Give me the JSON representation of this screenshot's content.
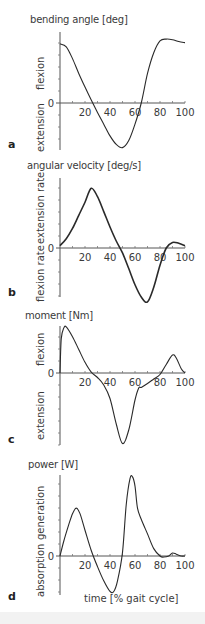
{
  "figure": {
    "xlabel": "time [% gait cycle]",
    "x_ticks": [
      "20",
      "40",
      "60",
      "80",
      "100"
    ],
    "zero_label": "0"
  },
  "panels": [
    {
      "letter": "a",
      "title": "bending angle  [deg]",
      "pos_label": "flexion",
      "neg_label": "extension"
    },
    {
      "letter": "b",
      "title": "angular velocity  [deg/s]",
      "pos_label": "extension rate",
      "neg_label": "flexion rate"
    },
    {
      "letter": "c",
      "title": "moment [Nm]",
      "pos_label": "flexion",
      "neg_label": "extension"
    },
    {
      "letter": "d",
      "title": "power [W]",
      "pos_label": "generation",
      "neg_label": "absorption"
    }
  ],
  "chart_data": [
    {
      "type": "line",
      "title": "bending angle [deg]",
      "xlabel": "time [% gait cycle]",
      "ylabel": "flexion (+) / extension (-)",
      "xlim": [
        0,
        100
      ],
      "ylim": [
        -1,
        1.2
      ],
      "grid": false,
      "x": [
        0,
        5,
        10,
        15,
        20,
        25,
        30,
        35,
        40,
        45,
        50,
        55,
        60,
        65,
        70,
        75,
        80,
        85,
        90,
        95,
        100
      ],
      "values": [
        1.0,
        0.95,
        0.75,
        0.5,
        0.27,
        0.05,
        -0.2,
        -0.45,
        -0.7,
        -0.88,
        -0.95,
        -0.8,
        -0.45,
        0.0,
        0.5,
        0.85,
        1.05,
        1.08,
        1.07,
        1.04,
        1.02
      ]
    },
    {
      "type": "line",
      "title": "angular velocity [deg/s]",
      "xlabel": "time [% gait cycle]",
      "ylabel": "extension rate (+) / flexion rate (-)",
      "xlim": [
        0,
        100
      ],
      "ylim": [
        -1,
        1.5
      ],
      "grid": false,
      "x": [
        0,
        5,
        10,
        15,
        20,
        25,
        30,
        35,
        40,
        45,
        50,
        55,
        60,
        65,
        70,
        75,
        80,
        85,
        90,
        95,
        100
      ],
      "values": [
        0.05,
        0.2,
        0.42,
        0.7,
        0.98,
        1.28,
        1.1,
        0.78,
        0.45,
        0.15,
        -0.1,
        -0.42,
        -0.75,
        -1.0,
        -1.1,
        -0.8,
        -0.35,
        0.0,
        0.12,
        0.1,
        0.05
      ]
    },
    {
      "type": "line",
      "title": "moment [Nm]",
      "xlabel": "time [% gait cycle]",
      "ylabel": "flexion (+) / extension (-)",
      "xlim": [
        0,
        100
      ],
      "ylim": [
        -2.4,
        1.1
      ],
      "grid": false,
      "x": [
        0,
        1,
        3,
        5,
        10,
        15,
        20,
        25,
        30,
        35,
        40,
        45,
        50,
        55,
        60,
        63,
        65,
        70,
        75,
        80,
        85,
        90,
        93,
        97,
        100
      ],
      "values": [
        0.0,
        0.8,
        1.05,
        1.08,
        0.85,
        0.55,
        0.25,
        0.02,
        -0.15,
        -0.4,
        -0.85,
        -1.7,
        -2.35,
        -1.9,
        -0.9,
        -0.5,
        -0.48,
        -0.35,
        -0.2,
        -0.05,
        0.2,
        0.42,
        0.35,
        0.1,
        0.0
      ]
    },
    {
      "type": "line",
      "title": "power [W]",
      "xlabel": "time [% gait cycle]",
      "ylabel": "generation (+) / absorption (-)",
      "xlim": [
        0,
        100
      ],
      "ylim": [
        -1.1,
        2.2
      ],
      "grid": false,
      "x": [
        0,
        3,
        7,
        10,
        13,
        16,
        20,
        25,
        30,
        35,
        40,
        43,
        46,
        50,
        53,
        56,
        58,
        60,
        62,
        65,
        70,
        75,
        80,
        83,
        87,
        90,
        93,
        97,
        100
      ],
      "values": [
        0.0,
        0.4,
        0.85,
        1.15,
        1.3,
        1.15,
        0.7,
        0.15,
        -0.3,
        -0.7,
        -1.0,
        -1.0,
        -0.7,
        0.1,
        1.4,
        2.1,
        2.15,
        1.9,
        1.3,
        1.0,
        0.6,
        0.2,
        0.0,
        -0.03,
        0.0,
        0.08,
        0.05,
        0.0,
        0.0
      ]
    }
  ]
}
